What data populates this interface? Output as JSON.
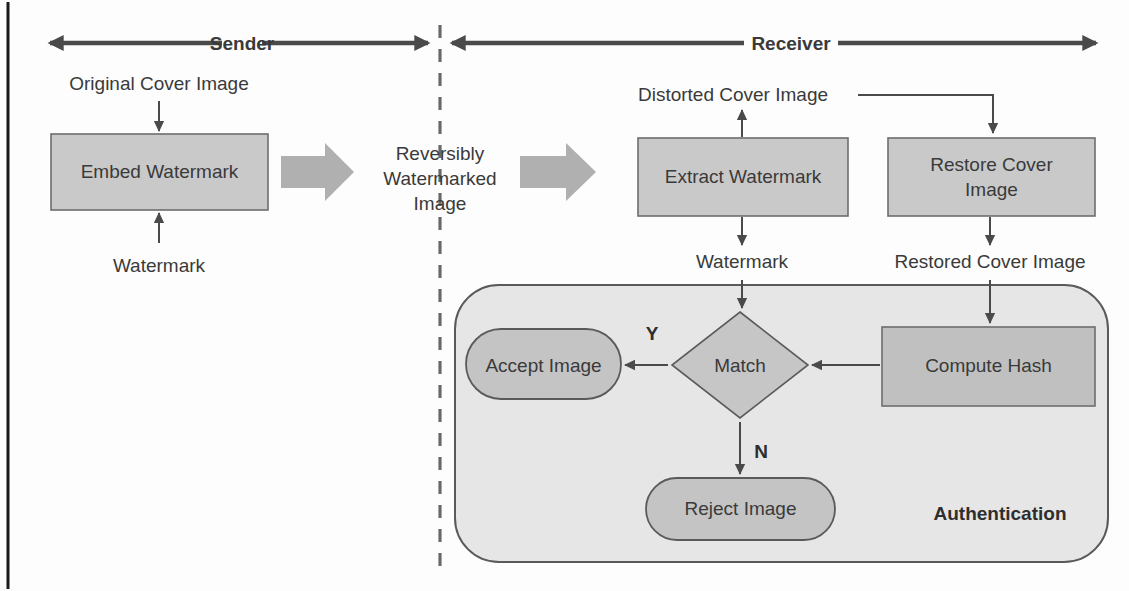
{
  "diagram": {
    "bands": [
      {
        "id": "sender",
        "label": "Sender"
      },
      {
        "id": "receiver",
        "label": "Receiver"
      }
    ],
    "process_boxes": [
      {
        "id": "embed-watermark",
        "label": "Embed Watermark"
      },
      {
        "id": "extract-watermark",
        "label": "Extract Watermark"
      },
      {
        "id": "restore-cover-image",
        "label": "Restore Cover\nImage",
        "line1": "Restore Cover",
        "line2": "Image"
      },
      {
        "id": "compute-hash",
        "label": "Compute Hash"
      }
    ],
    "decision": {
      "id": "match",
      "label": "Match"
    },
    "terminals": [
      {
        "id": "accept-image",
        "label": "Accept Image"
      },
      {
        "id": "reject-image",
        "label": "Reject Image"
      }
    ],
    "panel": {
      "id": "authentication",
      "label": "Authentication"
    },
    "flow_labels": [
      {
        "id": "original-cover-image",
        "label": "Original Cover Image"
      },
      {
        "id": "watermark-input",
        "label": "Watermark"
      },
      {
        "id": "reversibly-watermarked-image",
        "line1": "Reversibly",
        "line2": "Watermarked",
        "line3": "Image"
      },
      {
        "id": "distorted-cover-image",
        "label": "Distorted Cover Image"
      },
      {
        "id": "watermark-output",
        "label": "Watermark"
      },
      {
        "id": "restored-cover-image",
        "label": "Restored Cover Image"
      }
    ],
    "branch_labels": [
      {
        "id": "yes-branch",
        "label": "Y"
      },
      {
        "id": "no-branch",
        "label": "N"
      }
    ],
    "colors": {
      "process_fill": "#c9c9c9",
      "process_stroke": "#6d6d6d",
      "panel_fill": "#e6e6e6",
      "panel_stroke": "#5a5a5a",
      "connector": "#4a4a4a",
      "block_arrow": "#b0b0b0",
      "text": "#3a3a3a",
      "page_background": "#fdfdfd"
    }
  }
}
